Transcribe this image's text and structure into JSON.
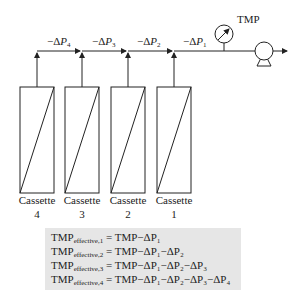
{
  "diagram": {
    "gauge_label": "TMP",
    "pressure_drops": [
      {
        "sign": "−Δ",
        "var": "P",
        "sub": "4"
      },
      {
        "sign": "−Δ",
        "var": "P",
        "sub": "3"
      },
      {
        "sign": "−Δ",
        "var": "P",
        "sub": "2"
      },
      {
        "sign": "−Δ",
        "var": "P",
        "sub": "1"
      }
    ],
    "cassettes": [
      {
        "name": "Cassette",
        "number": "4"
      },
      {
        "name": "Cassette",
        "number": "3"
      },
      {
        "name": "Cassette",
        "number": "2"
      },
      {
        "name": "Cassette",
        "number": "1"
      }
    ],
    "equations": [
      {
        "lhs": "TMP",
        "lhs_sub": "effective,1",
        "rhs": "= TMP−ΔP₁"
      },
      {
        "lhs": "TMP",
        "lhs_sub": "effective,2",
        "rhs": "= TMP−ΔP₁−ΔP₂"
      },
      {
        "lhs": "TMP",
        "lhs_sub": "effective,3",
        "rhs": "= TMP−ΔP₁−ΔP₂−ΔP₃"
      },
      {
        "lhs": "TMP",
        "lhs_sub": "effective,4",
        "rhs": "= TMP−ΔP₁−ΔP₂−ΔP₃−ΔP₄"
      }
    ],
    "colors": {
      "line": "#222222",
      "formula_bg": "#e6e6e6"
    }
  }
}
